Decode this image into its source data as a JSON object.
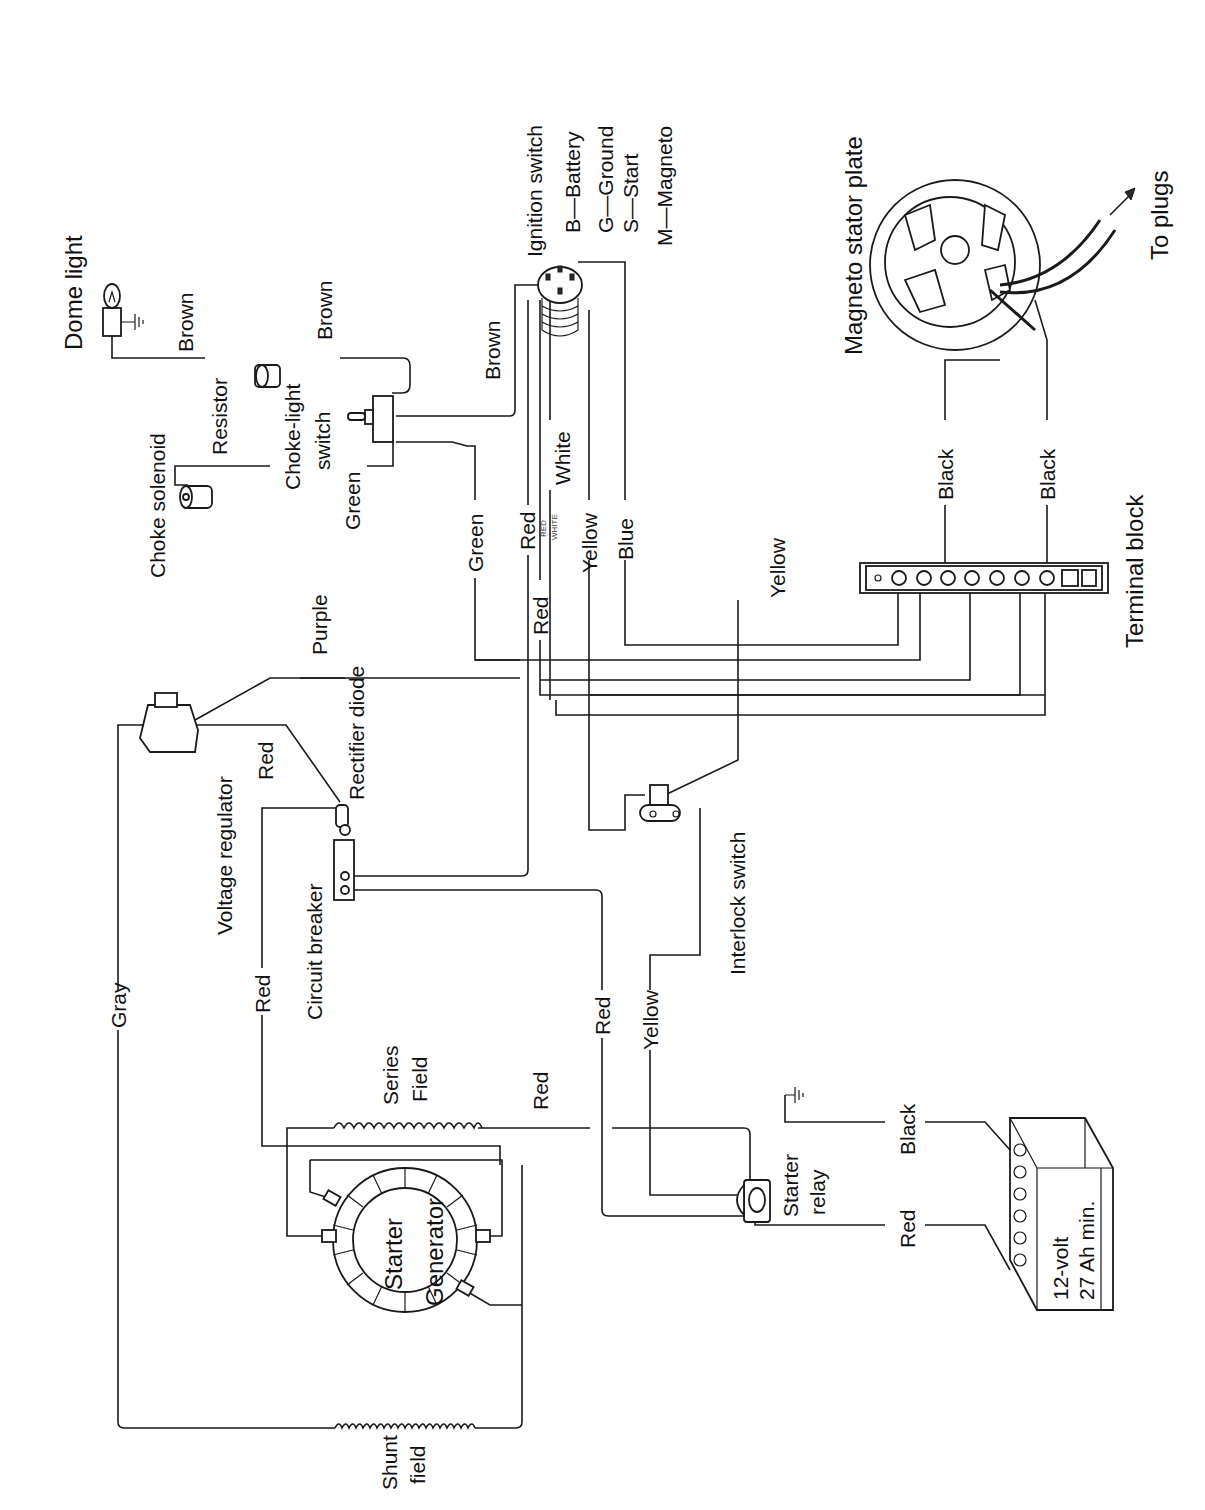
{
  "diagram": {
    "orientation": "rotated-90-ccw",
    "components": {
      "dome_light": "Dome light",
      "resistor": "Resistor",
      "choke_solenoid": "Choke solenoid",
      "choke_light_switch_line1": "Choke-light",
      "choke_light_switch_line2": "switch",
      "ignition_switch": "Ignition switch",
      "ignition_legend": [
        "B—Battery",
        "G—Ground",
        "S—Start",
        "M—Magneto"
      ],
      "magneto_stator_plate": "Magneto stator plate",
      "to_plugs": "To plugs",
      "terminal_block": "Terminal block",
      "voltage_regulator": "Voltage regulator",
      "rectifier_diode": "Rectifier diode",
      "circuit_breaker": "Circuit breaker",
      "interlock_switch": "Interlock switch",
      "series_field_line1": "Series",
      "series_field_line2": "Field",
      "shunt_field_line1": "Shunt",
      "shunt_field_line2": "field",
      "starter_generator_line1": "Starter",
      "starter_generator_line2": "Generator",
      "starter_relay_line1": "Starter",
      "starter_relay_line2": "relay",
      "battery_line1": "12-volt",
      "battery_line2": "27 Ah min."
    },
    "wire_labels": {
      "brown_dome": "Brown",
      "brown_switch": "Brown",
      "brown_ignition": "Brown",
      "green_switch": "Green",
      "green_main": "Green",
      "red_ign_upper": "Red",
      "red_ign_lower": "Red",
      "red_small": "RED",
      "white_small": "WHITE",
      "white": "White",
      "yellow_ign": "Yellow",
      "blue": "Blue",
      "yellow_tb": "Yellow",
      "black_1": "Black",
      "black_2": "Black",
      "purple": "Purple",
      "red_regulator": "Red",
      "red_cb": "Red",
      "gray": "Gray",
      "red_mid": "Red",
      "yellow_mid": "Yellow",
      "red_series": "Red",
      "black_battery": "Black",
      "red_battery": "Red"
    }
  }
}
